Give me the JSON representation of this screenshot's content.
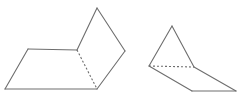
{
  "diagram": {
    "figures": [
      {
        "name": "folded-paper-left",
        "solid_edges": [
          [
            [
              5,
              89
            ],
            [
              28,
              49
            ]
          ],
          [
            [
              28,
              49
            ],
            [
              77,
              50
            ]
          ],
          [
            [
              5,
              89
            ],
            [
              97,
              89
            ]
          ],
          [
            [
              77,
              50
            ],
            [
              97,
              8
            ]
          ],
          [
            [
              97,
              8
            ],
            [
              125,
              51
            ]
          ],
          [
            [
              125,
              51
            ],
            [
              97,
              89
            ]
          ]
        ],
        "dashed_edges": [
          [
            [
              77,
              50
            ],
            [
              97,
              89
            ]
          ]
        ]
      },
      {
        "name": "folded-paper-right",
        "solid_edges": [
          [
            [
              149,
              66
            ],
            [
              172,
              26
            ]
          ],
          [
            [
              172,
              26
            ],
            [
              194,
              67
            ]
          ],
          [
            [
              149,
              66
            ],
            [
              192,
              91
            ]
          ],
          [
            [
              192,
              91
            ],
            [
              236,
              91
            ]
          ],
          [
            [
              236,
              91
            ],
            [
              194,
              67
            ]
          ]
        ],
        "dashed_edges": [
          [
            [
              149,
              66
            ],
            [
              194,
              67
            ]
          ]
        ]
      }
    ],
    "colors": {
      "stroke": "#6e6e6e",
      "background": "#ffffff"
    }
  }
}
